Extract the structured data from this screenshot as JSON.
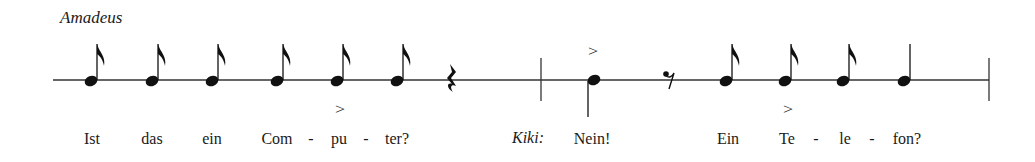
{
  "speakers": {
    "first": "Amadeus",
    "second": "Kiki:"
  },
  "staff": {
    "line_y": 80,
    "x_start": 53,
    "x_end": 989,
    "barlines": [
      541,
      989
    ]
  },
  "notes": [
    {
      "x": 91,
      "type": "eighth",
      "stem": "up"
    },
    {
      "x": 152,
      "type": "eighth",
      "stem": "up"
    },
    {
      "x": 212,
      "type": "eighth",
      "stem": "up"
    },
    {
      "x": 277,
      "type": "eighth",
      "stem": "up"
    },
    {
      "x": 337,
      "type": "eighth",
      "stem": "up",
      "accent": "below"
    },
    {
      "x": 397,
      "type": "eighth",
      "stem": "up"
    },
    {
      "x": 452,
      "type": "quarter-rest"
    },
    {
      "x": 593,
      "type": "quarter",
      "stem": "down",
      "accent": "above"
    },
    {
      "x": 668,
      "type": "eighth-rest"
    },
    {
      "x": 726,
      "type": "eighth",
      "stem": "up"
    },
    {
      "x": 785,
      "type": "eighth",
      "stem": "up",
      "accent": "below"
    },
    {
      "x": 843,
      "type": "eighth",
      "stem": "up"
    },
    {
      "x": 904,
      "type": "quarter",
      "stem": "up"
    }
  ],
  "accent_symbol": ">",
  "lyrics": {
    "w1": "Ist",
    "w2": "das",
    "w3": "ein",
    "w4": "Com",
    "w5": "pu",
    "w6": "ter?",
    "w7": "Nein!",
    "w8": "Ein",
    "w9": "Te",
    "w10": "le",
    "w11": "fon?",
    "hyphen": "-"
  }
}
